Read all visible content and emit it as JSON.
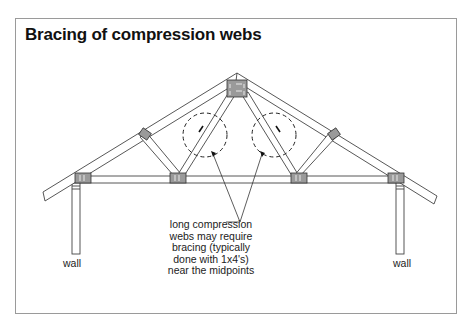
{
  "figure": {
    "title": "Bracing of compression webs",
    "labels": {
      "left_wall": "wall",
      "right_wall": "wall"
    },
    "callout": {
      "lines": [
        "long compression",
        "webs may require",
        "bracing (typically",
        "done with 1x4's)",
        "near the midpoints"
      ]
    },
    "elements": {
      "truss": "truss",
      "top_chords": 2,
      "bottom_chord": 1,
      "webs": 4,
      "gusset_plates": 7,
      "brace_circles": 2
    }
  }
}
